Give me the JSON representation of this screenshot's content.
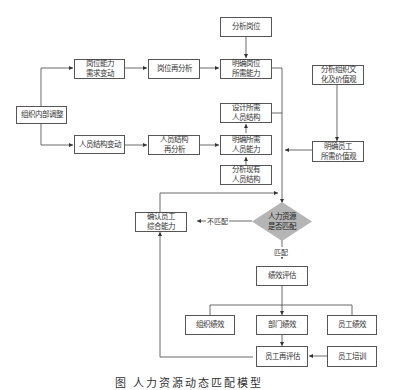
{
  "diagram": {
    "nodes": {
      "org_adjust": "组织内部调整",
      "position_demand_change": "岗位能力\n需求变动",
      "position_reanalysis": "岗位再分析",
      "analyze_position": "分析岗位",
      "define_position_ability": "明确岗位\n所需能力",
      "staff_structure_change": "人员结构变动",
      "staff_structure_reanalysis": "人员结构\n再分析",
      "design_staff_structure": "设计所需\n人员结构",
      "define_staff_ability": "明确所需\n人员能力",
      "analyze_existing_structure": "分析现有\n人员结构",
      "analyze_culture": "分析组织文\n化及价值观",
      "define_employee_values": "明确员工\n所需价值观",
      "hr_match_decision": "人力资源\n是否匹配",
      "confirm_employee_ability": "确认员工\n综合能力",
      "performance_eval": "绩效评估",
      "org_performance": "组织绩效",
      "dept_performance": "部门绩效",
      "employee_performance": "员工绩效",
      "employee_reeval": "员工再评估",
      "employee_training": "员工培训"
    },
    "edge_labels": {
      "no_match": "不匹配",
      "match": "匹配"
    },
    "colors": {
      "diamond_fill": "#b5b5b5",
      "line": "#444444",
      "box_border": "#555555"
    },
    "caption": "图  人力资源动态匹配模型"
  }
}
